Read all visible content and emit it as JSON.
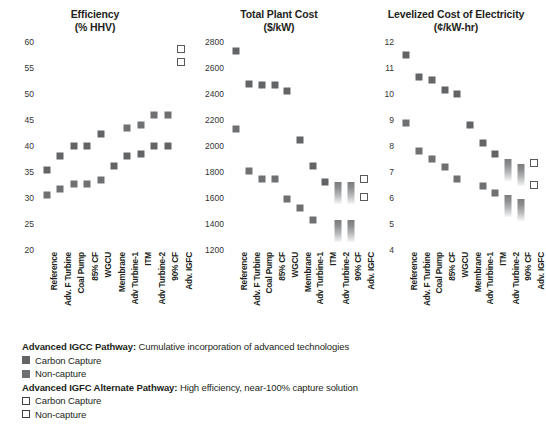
{
  "chart_data": [
    {
      "type": "scatter",
      "title": "Efficiency",
      "subtitle": "(% HHV)",
      "xlabel": "",
      "ylabel": "",
      "ylim": [
        20,
        60
      ],
      "yticks": [
        20,
        25,
        30,
        35,
        40,
        45,
        50,
        55,
        60
      ],
      "grid": false,
      "legend_position": "below-figure",
      "categories": [
        "Reference",
        "Adv. F Turbine",
        "Coal Pump",
        "85% CF",
        "WGCU",
        "Membrane",
        "Adv Turbine-1",
        "ITM",
        "Adv Turbine-2",
        "90% CF",
        "Adv. IGFC"
      ],
      "series": [
        {
          "name": "Non-capture",
          "marker": "filled-square",
          "values": [
            35.4,
            38.0,
            40.0,
            40.0,
            42.4,
            36.2,
            38.0,
            38.4,
            40.0,
            40.0,
            null
          ]
        },
        {
          "name": "Carbon Capture",
          "marker": "filled-square",
          "values": [
            30.6,
            31.8,
            32.6,
            32.6,
            33.4,
            null,
            43.4,
            44.0,
            46.0,
            46.0,
            null
          ]
        },
        {
          "name": "Non-capture (Alt. IGFC)",
          "marker": "open-square",
          "values": [
            null,
            null,
            null,
            null,
            null,
            null,
            null,
            null,
            null,
            null,
            58.6
          ]
        },
        {
          "name": "Carbon Capture (Alt. IGFC)",
          "marker": "open-square",
          "values": [
            null,
            null,
            null,
            null,
            null,
            null,
            null,
            null,
            null,
            null,
            56.2
          ]
        }
      ]
    },
    {
      "type": "scatter",
      "title": "Total Plant Cost",
      "subtitle": "($/kW)",
      "xlabel": "",
      "ylabel": "",
      "ylim": [
        1200,
        2800
      ],
      "yticks": [
        1200,
        1400,
        1600,
        1800,
        2000,
        2200,
        2400,
        2600,
        2800
      ],
      "grid": false,
      "legend_position": "below-figure",
      "categories": [
        "Reference",
        "Adv. F Turbine",
        "Coal Pump",
        "85% CF",
        "WGCU",
        "Membrane",
        "Adv Turbine-1",
        "ITM",
        "Adv Turbine-2",
        "90% CF",
        "Adv. IGFC"
      ],
      "series": [
        {
          "name": "Carbon Capture",
          "marker": "filled-square",
          "values": [
            2730,
            2480,
            2470,
            2470,
            2420,
            2050,
            1850,
            1720,
            1690,
            1690,
            null
          ]
        },
        {
          "name": "Non-capture",
          "marker": "filled-square",
          "values": [
            2130,
            1810,
            1750,
            1750,
            1590,
            1520,
            1430,
            null,
            1400,
            1400,
            null
          ]
        },
        {
          "name": "Carbon Capture (Alt. IGFC)",
          "marker": "open-square",
          "values": [
            null,
            null,
            null,
            null,
            null,
            null,
            null,
            null,
            null,
            null,
            1750
          ]
        },
        {
          "name": "Non-capture (Alt. IGFC)",
          "marker": "open-square",
          "values": [
            null,
            null,
            null,
            null,
            null,
            null,
            null,
            null,
            null,
            null,
            1610
          ]
        }
      ]
    },
    {
      "type": "scatter",
      "title": "Levelized Cost of Electricity",
      "subtitle": "(¢/kW-hr)",
      "xlabel": "",
      "ylabel": "",
      "ylim": [
        4,
        12
      ],
      "yticks": [
        4,
        5,
        6,
        7,
        8,
        9,
        10,
        11,
        12
      ],
      "grid": false,
      "legend_position": "below-figure",
      "categories": [
        "Reference",
        "Adv. F Turbine",
        "Coal Pump",
        "85% CF",
        "WGCU",
        "Membrane",
        "Adv Turbine-1",
        "ITM",
        "Adv Turbine-2",
        "90% CF",
        "Adv. IGFC"
      ],
      "series": [
        {
          "name": "Carbon Capture",
          "marker": "filled-square",
          "values": [
            11.5,
            10.65,
            10.55,
            10.15,
            10.0,
            8.8,
            8.1,
            7.7,
            7.35,
            7.15,
            null
          ]
        },
        {
          "name": "Non-capture",
          "marker": "filled-square",
          "values": [
            8.9,
            7.8,
            7.5,
            7.2,
            6.75,
            null,
            6.45,
            6.2,
            5.95,
            5.8,
            null
          ]
        },
        {
          "name": "Carbon Capture (Alt. IGFC)",
          "marker": "open-square",
          "values": [
            null,
            null,
            null,
            null,
            null,
            null,
            null,
            null,
            null,
            null,
            7.35
          ]
        },
        {
          "name": "Non-capture (Alt. IGFC)",
          "marker": "open-square",
          "values": [
            null,
            null,
            null,
            null,
            null,
            null,
            null,
            null,
            null,
            null,
            6.5
          ]
        }
      ]
    }
  ],
  "legend": {
    "groups": [
      {
        "heading": "Advanced IGCC Pathway:",
        "description": "Cumulative incorporation of advanced technologies",
        "items": [
          {
            "label": "Carbon Capture",
            "swatch": "filled-square-dark"
          },
          {
            "label": "Non-capture",
            "swatch": "filled-square-gray"
          }
        ]
      },
      {
        "heading": "Advanced IGFC Alternate Pathway:",
        "description": "High efficiency, near-100% capture solution",
        "items": [
          {
            "label": "Carbon Capture",
            "swatch": "open-square"
          },
          {
            "label": "Non-capture",
            "swatch": "open-square"
          }
        ]
      }
    ]
  },
  "colors": {
    "carbon_capture": "#636466",
    "non_capture": "#6f7072",
    "open_marker_border": "#58595b",
    "text": "#231f20",
    "background": "#ffffff"
  },
  "caption": ""
}
